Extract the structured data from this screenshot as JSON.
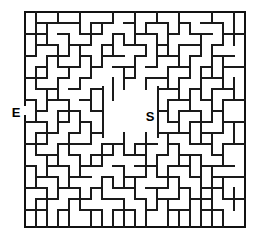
{
  "figure": {
    "kind": "maze-puzzle",
    "width": 262,
    "height": 241,
    "background_color": "#ffffff",
    "wall_color": "#1a1a1a"
  },
  "maze": {
    "origin_x": 25,
    "origin_y": 12,
    "cell_size": 11,
    "cols": 20,
    "rows": 19.5,
    "border": {
      "left": 25,
      "top": 12,
      "right": 245,
      "bottom": 227
    },
    "entrance": {
      "label": "E",
      "side": "left",
      "x": 16,
      "y": 117,
      "gap_y_start": 105,
      "gap_y_end": 116
    },
    "goal": {
      "label": "S",
      "x": 150,
      "y": 121
    },
    "center_room": {
      "x": 103,
      "y": 87,
      "width": 55,
      "height": 50
    },
    "border_segments": [
      [
        25,
        12,
        245,
        12
      ],
      [
        25,
        227,
        245,
        227
      ],
      [
        245,
        12,
        245,
        227
      ],
      [
        25,
        12,
        25,
        105
      ],
      [
        25,
        116,
        25,
        227
      ]
    ],
    "h_walls": [
      [
        36,
        23,
        80
      ],
      [
        91,
        23,
        113
      ],
      [
        124,
        23,
        135
      ],
      [
        146,
        23,
        168
      ],
      [
        179,
        23,
        190
      ],
      [
        201,
        23,
        223
      ],
      [
        25,
        34,
        47
      ],
      [
        58,
        34,
        69
      ],
      [
        80,
        34,
        102
      ],
      [
        113,
        34,
        124
      ],
      [
        135,
        34,
        157
      ],
      [
        168,
        34,
        179
      ],
      [
        190,
        34,
        212
      ],
      [
        223,
        34,
        245
      ],
      [
        36,
        45,
        58
      ],
      [
        69,
        45,
        91
      ],
      [
        102,
        45,
        113
      ],
      [
        124,
        45,
        146
      ],
      [
        157,
        45,
        168
      ],
      [
        179,
        45,
        201
      ],
      [
        212,
        45,
        223
      ],
      [
        25,
        56,
        36
      ],
      [
        47,
        56,
        69
      ],
      [
        80,
        56,
        91
      ],
      [
        102,
        56,
        124
      ],
      [
        135,
        56,
        146
      ],
      [
        157,
        56,
        179
      ],
      [
        190,
        56,
        201
      ],
      [
        212,
        56,
        234
      ],
      [
        36,
        67,
        47
      ],
      [
        58,
        67,
        80
      ],
      [
        91,
        67,
        102
      ],
      [
        113,
        67,
        135
      ],
      [
        146,
        67,
        157
      ],
      [
        168,
        67,
        190
      ],
      [
        201,
        67,
        212
      ],
      [
        223,
        67,
        245
      ],
      [
        25,
        78,
        47
      ],
      [
        58,
        78,
        69
      ],
      [
        80,
        78,
        91
      ],
      [
        124,
        78,
        135
      ],
      [
        146,
        78,
        168
      ],
      [
        179,
        78,
        190
      ],
      [
        201,
        78,
        223
      ],
      [
        36,
        89,
        58
      ],
      [
        69,
        89,
        80
      ],
      [
        91,
        89,
        103
      ],
      [
        158,
        89,
        179
      ],
      [
        190,
        89,
        201
      ],
      [
        212,
        89,
        234
      ],
      [
        25,
        100,
        36
      ],
      [
        47,
        100,
        69
      ],
      [
        80,
        100,
        91
      ],
      [
        168,
        100,
        190
      ],
      [
        201,
        100,
        212
      ],
      [
        223,
        100,
        245
      ],
      [
        36,
        111,
        47
      ],
      [
        58,
        111,
        80
      ],
      [
        91,
        111,
        103
      ],
      [
        158,
        111,
        168
      ],
      [
        179,
        111,
        201
      ],
      [
        212,
        111,
        223
      ],
      [
        25,
        122,
        47
      ],
      [
        58,
        122,
        69
      ],
      [
        80,
        122,
        91
      ],
      [
        168,
        122,
        179
      ],
      [
        190,
        122,
        212
      ],
      [
        223,
        122,
        245
      ],
      [
        36,
        133,
        58
      ],
      [
        69,
        133,
        80
      ],
      [
        91,
        133,
        103
      ],
      [
        158,
        133,
        190
      ],
      [
        201,
        133,
        223
      ],
      [
        25,
        144,
        47
      ],
      [
        58,
        144,
        91
      ],
      [
        102,
        144,
        124
      ],
      [
        135,
        144,
        157
      ],
      [
        168,
        144,
        179
      ],
      [
        190,
        144,
        212
      ],
      [
        223,
        144,
        245
      ],
      [
        36,
        155,
        58
      ],
      [
        69,
        155,
        80
      ],
      [
        91,
        155,
        113
      ],
      [
        124,
        155,
        146
      ],
      [
        157,
        155,
        168
      ],
      [
        179,
        155,
        201
      ],
      [
        212,
        155,
        223
      ],
      [
        25,
        166,
        36
      ],
      [
        47,
        166,
        69
      ],
      [
        80,
        166,
        102
      ],
      [
        113,
        166,
        124
      ],
      [
        135,
        166,
        157
      ],
      [
        168,
        166,
        190
      ],
      [
        201,
        166,
        234
      ],
      [
        36,
        177,
        58
      ],
      [
        69,
        177,
        91
      ],
      [
        102,
        177,
        113
      ],
      [
        124,
        177,
        146
      ],
      [
        157,
        177,
        179
      ],
      [
        190,
        177,
        201
      ],
      [
        212,
        177,
        245
      ],
      [
        25,
        188,
        47
      ],
      [
        58,
        188,
        80
      ],
      [
        91,
        188,
        102
      ],
      [
        113,
        188,
        135
      ],
      [
        146,
        188,
        168
      ],
      [
        179,
        188,
        190
      ],
      [
        201,
        188,
        223
      ],
      [
        36,
        199,
        58
      ],
      [
        69,
        199,
        91
      ],
      [
        102,
        199,
        124
      ],
      [
        135,
        199,
        146
      ],
      [
        157,
        199,
        179
      ],
      [
        190,
        199,
        212
      ],
      [
        223,
        199,
        245
      ],
      [
        25,
        210,
        47
      ],
      [
        58,
        210,
        69
      ],
      [
        80,
        210,
        102
      ],
      [
        113,
        210,
        135
      ],
      [
        146,
        210,
        157
      ],
      [
        168,
        210,
        190
      ],
      [
        201,
        210,
        223
      ]
    ],
    "v_walls": [
      [
        36,
        12,
        34
      ],
      [
        58,
        12,
        23
      ],
      [
        80,
        12,
        34
      ],
      [
        113,
        12,
        23
      ],
      [
        135,
        12,
        45
      ],
      [
        157,
        12,
        23
      ],
      [
        179,
        12,
        34
      ],
      [
        212,
        12,
        23
      ],
      [
        234,
        12,
        45
      ],
      [
        47,
        23,
        45
      ],
      [
        91,
        23,
        45
      ],
      [
        102,
        23,
        34
      ],
      [
        146,
        23,
        34
      ],
      [
        168,
        23,
        56
      ],
      [
        190,
        23,
        34
      ],
      [
        223,
        23,
        45
      ],
      [
        36,
        34,
        56
      ],
      [
        69,
        34,
        56
      ],
      [
        113,
        34,
        56
      ],
      [
        124,
        34,
        45
      ],
      [
        157,
        34,
        67
      ],
      [
        201,
        34,
        56
      ],
      [
        58,
        45,
        67
      ],
      [
        80,
        45,
        67
      ],
      [
        102,
        45,
        67
      ],
      [
        146,
        45,
        56
      ],
      [
        179,
        45,
        67
      ],
      [
        212,
        45,
        78
      ],
      [
        47,
        56,
        78
      ],
      [
        91,
        56,
        78
      ],
      [
        135,
        56,
        78
      ],
      [
        190,
        56,
        78
      ],
      [
        223,
        56,
        89
      ],
      [
        36,
        67,
        89
      ],
      [
        69,
        67,
        78
      ],
      [
        124,
        67,
        89
      ],
      [
        168,
        67,
        89
      ],
      [
        201,
        67,
        100
      ],
      [
        58,
        78,
        100
      ],
      [
        80,
        78,
        89
      ],
      [
        113,
        78,
        100
      ],
      [
        146,
        78,
        89
      ],
      [
        179,
        78,
        100
      ],
      [
        234,
        78,
        100
      ],
      [
        47,
        89,
        111
      ],
      [
        91,
        89,
        111
      ],
      [
        103,
        87,
        137
      ],
      [
        158,
        87,
        137
      ],
      [
        190,
        89,
        111
      ],
      [
        212,
        89,
        122
      ],
      [
        36,
        100,
        122
      ],
      [
        69,
        100,
        122
      ],
      [
        168,
        100,
        122
      ],
      [
        223,
        100,
        133
      ],
      [
        58,
        111,
        133
      ],
      [
        80,
        111,
        133
      ],
      [
        179,
        111,
        133
      ],
      [
        201,
        111,
        144
      ],
      [
        47,
        122,
        144
      ],
      [
        91,
        122,
        144
      ],
      [
        190,
        122,
        144
      ],
      [
        234,
        122,
        144
      ],
      [
        36,
        133,
        155
      ],
      [
        69,
        133,
        155
      ],
      [
        124,
        133,
        155
      ],
      [
        146,
        133,
        166
      ],
      [
        168,
        133,
        155
      ],
      [
        212,
        133,
        155
      ],
      [
        58,
        144,
        166
      ],
      [
        102,
        144,
        166
      ],
      [
        113,
        144,
        155
      ],
      [
        135,
        144,
        155
      ],
      [
        179,
        144,
        166
      ],
      [
        223,
        144,
        166
      ],
      [
        47,
        155,
        177
      ],
      [
        80,
        155,
        177
      ],
      [
        91,
        155,
        166
      ],
      [
        157,
        155,
        177
      ],
      [
        190,
        155,
        177
      ],
      [
        201,
        155,
        188
      ],
      [
        36,
        166,
        188
      ],
      [
        69,
        166,
        188
      ],
      [
        124,
        166,
        188
      ],
      [
        146,
        166,
        177
      ],
      [
        168,
        166,
        188
      ],
      [
        212,
        166,
        199
      ],
      [
        58,
        177,
        199
      ],
      [
        102,
        177,
        199
      ],
      [
        113,
        177,
        188
      ],
      [
        135,
        177,
        199
      ],
      [
        179,
        177,
        199
      ],
      [
        223,
        177,
        199
      ],
      [
        47,
        188,
        210
      ],
      [
        80,
        188,
        210
      ],
      [
        91,
        188,
        199
      ],
      [
        157,
        188,
        210
      ],
      [
        190,
        188,
        210
      ],
      [
        201,
        188,
        227
      ],
      [
        234,
        188,
        210
      ],
      [
        36,
        199,
        227
      ],
      [
        69,
        199,
        227
      ],
      [
        124,
        199,
        227
      ],
      [
        146,
        199,
        227
      ],
      [
        168,
        199,
        227
      ],
      [
        212,
        199,
        227
      ],
      [
        58,
        210,
        227
      ],
      [
        102,
        210,
        227
      ],
      [
        113,
        210,
        227
      ],
      [
        135,
        210,
        227
      ],
      [
        179,
        210,
        227
      ],
      [
        223,
        210,
        227
      ],
      [
        91,
        210,
        227
      ],
      [
        190,
        210,
        227
      ],
      [
        47,
        210,
        227
      ],
      [
        80,
        199,
        210
      ]
    ]
  }
}
